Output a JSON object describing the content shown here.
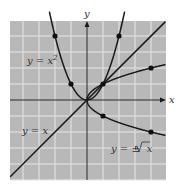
{
  "chart_data": {
    "type": "line",
    "title": "",
    "xlabel": "x",
    "ylabel": "y",
    "xlim": [
      -4.8,
      4.9
    ],
    "ylim": [
      -5.0,
      4.9
    ],
    "grid": true,
    "series": [
      {
        "name": "y = x^2",
        "label": "y = x²",
        "points": [
          [
            -2,
            4
          ],
          [
            -1,
            1
          ],
          [
            0,
            0
          ],
          [
            1,
            1
          ],
          [
            2,
            4
          ]
        ]
      },
      {
        "name": "y = x",
        "label": "y = x",
        "points": [
          [
            -4.8,
            -4.8
          ],
          [
            4.9,
            4.9
          ]
        ]
      },
      {
        "name": "y = ±√x",
        "label": "y = ±√x",
        "points": [
          [
            0,
            0
          ],
          [
            1,
            1
          ],
          [
            4,
            2
          ],
          [
            1,
            -1
          ],
          [
            4,
            -2
          ]
        ]
      }
    ],
    "marked_points": [
      [
        -2,
        4
      ],
      [
        2,
        4
      ],
      [
        -1,
        1
      ],
      [
        1,
        1
      ],
      [
        4,
        2
      ],
      [
        1,
        -1
      ],
      [
        4,
        -2
      ]
    ]
  },
  "axes": {
    "x_label": "x",
    "y_label": "y"
  },
  "labels": {
    "parabola": "y = x",
    "parabola_exp": "2",
    "line": "y = x",
    "sqrt_prefix": "y = ±",
    "sqrt_arg": "x"
  },
  "colors": {
    "grid_bg": "#b8b8b8",
    "grid_line": "#e6e6e6",
    "curve": "#1a1a1a",
    "text": "#333333"
  }
}
